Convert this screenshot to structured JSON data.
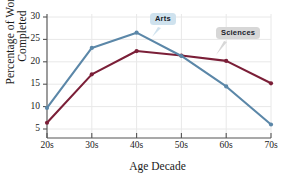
{
  "chart_data": {
    "type": "line",
    "title": "",
    "xlabel": "Age Decade",
    "ylabel_line1": "Percentage of Works",
    "ylabel_line2": "Completed",
    "categories": [
      "20s",
      "30s",
      "40s",
      "50s",
      "60s",
      "70s"
    ],
    "yticks": [
      5,
      10,
      15,
      20,
      25,
      30
    ],
    "ylim": [
      3.0,
      31.0
    ],
    "grid": true,
    "legend_position": "inline-callouts",
    "series": [
      {
        "name": "Arts",
        "color": "#5B87A8",
        "values": [
          9.7,
          23.1,
          26.5,
          21.3,
          14.5,
          6.0
        ]
      },
      {
        "name": "Sciences",
        "color": "#7B1F38",
        "values": [
          6.4,
          17.2,
          22.4,
          21.4,
          20.2,
          15.2
        ]
      }
    ],
    "annotations": [
      {
        "text": "Arts",
        "series": "Arts",
        "box_color": "#cfe2ee"
      },
      {
        "text": "Sciences",
        "series": "Sciences",
        "box_color": "#d7d7d7"
      }
    ]
  },
  "axis": {
    "y_tick_labels": [
      "30",
      "25",
      "20",
      "15",
      "10",
      "5"
    ],
    "x_tick_labels": [
      "20s",
      "30s",
      "40s",
      "50s",
      "60s",
      "70s"
    ],
    "x_title": "Age Decade",
    "y_title_line1": "Percentage of Works",
    "y_title_line2": "Completed"
  },
  "callouts": {
    "arts": "Arts",
    "sciences": "Sciences"
  },
  "header": {
    "partial_title": ""
  },
  "colors": {
    "arts": "#5B87A8",
    "sciences": "#7B1F38",
    "grid": "#e3e3e3",
    "axis": "#5a5a5a",
    "background": "#ffffff"
  }
}
